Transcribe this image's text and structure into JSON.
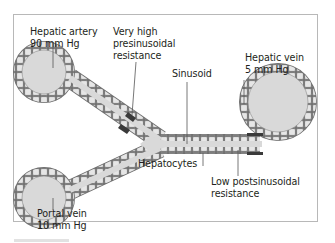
{
  "diagram": {
    "labels": {
      "hepatic_artery": {
        "line1": "Hepatic artery",
        "line2": "90 mm Hg"
      },
      "presinusoidal": {
        "line1": "Very high",
        "line2": "presinusoidal",
        "line3": "resistance"
      },
      "sinusoid": "Sinusoid",
      "hepatic_vein": {
        "line1": "Hepatic vein",
        "line2": "5 mm Hg"
      },
      "hepatocytes": "Hepatocytes",
      "portal_vein": {
        "line1": "Portal vein",
        "line2": "10 mm Hg"
      },
      "postsinusoidal": {
        "line1": "Low postsinusoidal",
        "line2": "resistance"
      }
    },
    "colors": {
      "lumen": "#d9d9d9",
      "cell_fill": "#e6e6e6",
      "cell_stroke": "#6d6d6d",
      "resistance_block": "#3a3a3a",
      "leader_line": "#555555",
      "frame": "#b8b8b8"
    }
  }
}
